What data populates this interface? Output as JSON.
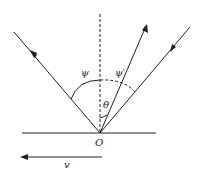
{
  "diagram": {
    "labels": {
      "psi": "ψ",
      "psi_prime": "ψ′",
      "theta": "θ",
      "origin": "O",
      "velocity": "v"
    },
    "colors": {
      "stroke": "#222222",
      "background": "#ffffff"
    }
  }
}
